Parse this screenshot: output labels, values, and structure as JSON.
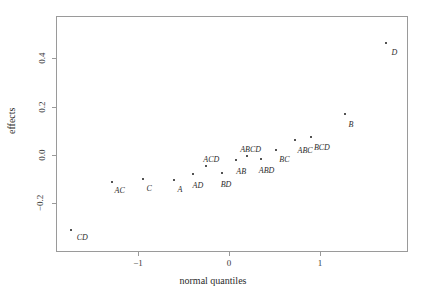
{
  "chart_data": {
    "type": "scatter",
    "title": "",
    "xlabel": "normal quantiles",
    "ylabel": "effects",
    "xlim": [
      -1.95,
      1.92
    ],
    "ylim": [
      -0.36,
      0.52
    ],
    "grid": false,
    "legend": "none",
    "xticks": [
      -1,
      0,
      1
    ],
    "xticklabels": [
      "−1",
      "0",
      "1"
    ],
    "yticks": [
      -0.2,
      0.0,
      0.2,
      0.4
    ],
    "yticklabels": [
      "−0.2",
      "0.0",
      "0.2",
      "0.4"
    ],
    "point_labels": [
      "CD",
      "AC",
      "C",
      "A",
      "AD",
      "ACD",
      "BD",
      "AB",
      "ABCD",
      "ABD",
      "BC",
      "ABC",
      "BCD",
      "B",
      "D"
    ],
    "x": [
      -1.74,
      -1.29,
      -0.95,
      -0.6,
      -0.4,
      -0.25,
      -0.08,
      0.08,
      0.2,
      0.35,
      0.52,
      0.72,
      0.9,
      1.27,
      1.73
    ],
    "y": [
      -0.31,
      -0.11,
      -0.1,
      -0.105,
      -0.08,
      -0.045,
      -0.075,
      -0.02,
      -0.005,
      -0.015,
      0.02,
      0.06,
      0.075,
      0.17,
      0.465
    ],
    "points": [
      {
        "label": "CD",
        "x": -1.74,
        "y": -0.31,
        "lx": 6,
        "ly": 4
      },
      {
        "label": "AC",
        "x": -1.29,
        "y": -0.11,
        "lx": 3,
        "ly": 5
      },
      {
        "label": "C",
        "x": -0.95,
        "y": -0.1,
        "lx": 4,
        "ly": 6
      },
      {
        "label": "A",
        "x": -0.6,
        "y": -0.105,
        "lx": 3,
        "ly": 6
      },
      {
        "label": "AD",
        "x": -0.4,
        "y": -0.08,
        "lx": 0,
        "ly": 8
      },
      {
        "label": "ACD",
        "x": -0.25,
        "y": -0.045,
        "lx": -3,
        "ly": -10
      },
      {
        "label": "BD",
        "x": -0.08,
        "y": -0.075,
        "lx": -1,
        "ly": 8
      },
      {
        "label": "AB",
        "x": 0.08,
        "y": -0.02,
        "lx": 0,
        "ly": 8
      },
      {
        "label": "ABCD",
        "x": 0.2,
        "y": -0.005,
        "lx": -7,
        "ly": -10
      },
      {
        "label": "ABD",
        "x": 0.35,
        "y": -0.015,
        "lx": -2,
        "ly": 8
      },
      {
        "label": "BC",
        "x": 0.52,
        "y": 0.02,
        "lx": 3,
        "ly": 6
      },
      {
        "label": "ABC",
        "x": 0.72,
        "y": 0.06,
        "lx": 3,
        "ly": 7
      },
      {
        "label": "BCD",
        "x": 0.9,
        "y": 0.075,
        "lx": 3,
        "ly": 7
      },
      {
        "label": "B",
        "x": 1.27,
        "y": 0.17,
        "lx": 4,
        "ly": 7
      },
      {
        "label": "D",
        "x": 1.73,
        "y": 0.465,
        "lx": 5,
        "ly": 6
      }
    ],
    "colors": {
      "point": "#1a1a1a",
      "axis": "#9a9a9a",
      "text": "#2b2b2b",
      "background": "#ffffff"
    }
  }
}
